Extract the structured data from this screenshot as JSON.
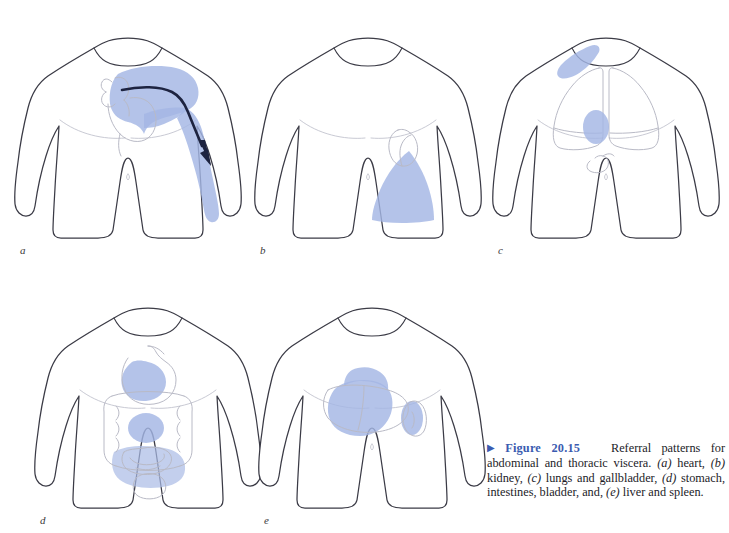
{
  "figure": {
    "number_label": "Figure 20.15",
    "bullet_icon": "triangle-right-icon",
    "caption_text": "Referral patterns for abdominal and thoracic viscera. (a) heart, (b) kidney, (c) lungs and gallbladder, (d) stomach, intestines, bladder, and, (e) liver and spleen.",
    "caption_number_color": "#3a5bb0",
    "caption_body_color": "#1c1c28",
    "referral_shade_color": "#a3b6e4",
    "body_outline_color": "#3b3b46",
    "organ_outline_color": "#b9bac6",
    "arrow_color": "#1d2340"
  },
  "panels": [
    {
      "id": "a",
      "label": "a",
      "viscera": "heart",
      "referral_regions": [
        "left chest / precordium",
        "left shoulder",
        "medial left arm to forearm"
      ],
      "has_arrow": true,
      "arrow_description": "dark arrow curving from heart across left shoulder and down the inner left arm"
    },
    {
      "id": "b",
      "label": "b",
      "viscera": "kidney",
      "referral_regions": [
        "left flank",
        "diagonal band toward groin / inguinal region"
      ],
      "has_arrow": false,
      "organ_outline": "kidney"
    },
    {
      "id": "c",
      "label": "c",
      "viscera": "lungs and gallbladder",
      "referral_regions": [
        "right supraclavicular / shoulder patch",
        "right subcostal oval over gallbladder"
      ],
      "has_arrow": false,
      "organ_outline": "lungs and gallbladder"
    },
    {
      "id": "d",
      "label": "d",
      "viscera": "stomach, intestines, bladder",
      "referral_regions": [
        "epigastric region (stomach)",
        "periumbilical region (small intestine)",
        "suprapubic / pelvic region (bladder and colon)"
      ],
      "has_arrow": false,
      "organ_outline": "stomach, small and large intestine, bladder"
    },
    {
      "id": "e",
      "label": "e",
      "viscera": "liver and spleen",
      "referral_regions": [
        "right upper quadrant and right costal margin (liver)",
        "left lateral costal oval (spleen)"
      ],
      "has_arrow": false,
      "organ_outline": "liver and spleen"
    }
  ]
}
